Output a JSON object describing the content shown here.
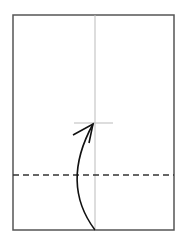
{
  "diagram": {
    "type": "origami-fold-step",
    "paper": {
      "x": 13,
      "y": 15,
      "width": 161,
      "height": 215,
      "stroke": "#555555"
    },
    "center_crease": {
      "x": 95,
      "y1": 15,
      "y2": 230,
      "stroke": "#bbbbbb"
    },
    "target_mark": {
      "y": 123,
      "x1": 74,
      "x2": 113,
      "stroke": "#bbbbbb"
    },
    "valley_fold_line": {
      "y": 175,
      "x1": 13,
      "x2": 174,
      "stroke": "#333333",
      "dash": "6,4"
    },
    "fold_arrow": {
      "path": "M95,230 C80,210 65,175 93,124",
      "head": [
        [
          73,
          135
        ],
        [
          93,
          124
        ],
        [
          89,
          143
        ]
      ],
      "stroke": "#111111"
    }
  }
}
